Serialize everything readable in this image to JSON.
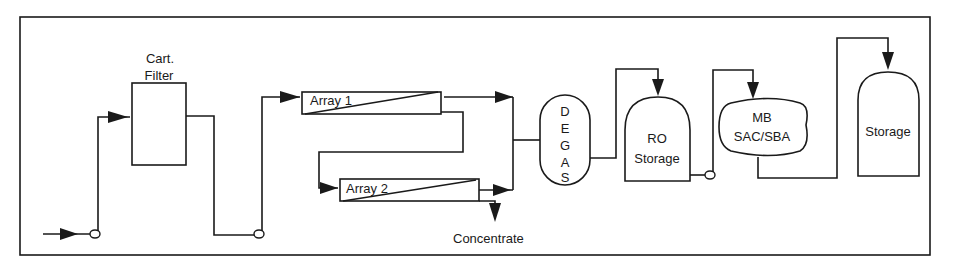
{
  "diagram": {
    "type": "process-flow",
    "title": "",
    "nodes": {
      "cart_filter": {
        "label_line1": "Cart.",
        "label_line2": "Filter"
      },
      "array1": {
        "label": "Array 1"
      },
      "array2": {
        "label": "Array 2"
      },
      "concentrate": {
        "label": "Concentrate"
      },
      "degas": {
        "letters": [
          "D",
          "E",
          "G",
          "A",
          "S"
        ]
      },
      "ro_storage": {
        "label_line1": "RO",
        "label_line2": "Storage"
      },
      "mb": {
        "label_line1": "MB",
        "label_line2": "SAC/SBA"
      },
      "storage": {
        "label": "Storage"
      }
    },
    "edges": [
      "Feed -> Pump 1 -> Cart. Filter",
      "Cart. Filter -> Pump 2 -> Array 1",
      "Array 1 (concentrate) -> Array 2",
      "Array 1 (permeate) -> DEGAS",
      "Array 2 (permeate) -> DEGAS",
      "Array 2 -> Concentrate",
      "DEGAS -> RO Storage",
      "RO Storage -> Pump 3 -> MB SAC/SBA",
      "MB SAC/SBA -> Storage"
    ],
    "colors": {
      "line": "#1a1a1a",
      "background": "#ffffff"
    }
  }
}
